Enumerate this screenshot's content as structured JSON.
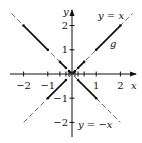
{
  "figure": {
    "axis_labels": {
      "x": "x",
      "y": "y"
    },
    "x_ticks": [
      {
        "value": -2,
        "label": "−2"
      },
      {
        "value": -1,
        "label": "−1"
      },
      {
        "value": 1,
        "label": "1"
      },
      {
        "value": 2,
        "label": "2"
      }
    ],
    "y_ticks": [
      {
        "value": 2,
        "label": "2"
      },
      {
        "value": 1,
        "label": "1"
      },
      {
        "value": -1,
        "label": "−1"
      },
      {
        "value": -2,
        "label": "−2"
      }
    ],
    "line_labels": {
      "y_eq_x": "y = x",
      "y_eq_neg_x": "y = −x",
      "g": "g"
    },
    "guide_lines": [
      {
        "name": "y = x",
        "from": [
          -2.0,
          -2.0
        ],
        "to": [
          2.5,
          2.5
        ],
        "style": "dashed"
      },
      {
        "name": "y = -x",
        "from": [
          -2.5,
          2.5
        ],
        "to": [
          2.0,
          -2.0
        ],
        "style": "dashed"
      }
    ],
    "g_segments": [
      {
        "from": [
          1,
          1
        ],
        "to": [
          2,
          2
        ]
      },
      {
        "from": [
          -2,
          2
        ],
        "to": [
          -1,
          1
        ]
      },
      {
        "from": [
          -1,
          -1
        ],
        "to": [
          -0.25,
          -0.25
        ]
      },
      {
        "from": [
          0.25,
          -0.25
        ],
        "to": [
          1,
          -1
        ]
      },
      {
        "from": [
          -0.5,
          0.5
        ],
        "to": [
          -0.25,
          0.25
        ]
      },
      {
        "from": [
          0.25,
          0.25
        ],
        "to": [
          0.5,
          0.5
        ]
      },
      {
        "from": [
          -0.125,
          0.125
        ],
        "to": [
          -0.0625,
          0.0625
        ]
      },
      {
        "from": [
          0.0625,
          0.0625
        ],
        "to": [
          0.125,
          0.125
        ]
      }
    ],
    "colors": {
      "ink": "#111111",
      "background": "#ffffff"
    }
  }
}
